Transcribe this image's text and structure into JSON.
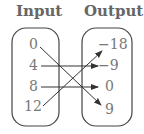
{
  "headers": {
    "input": "Input",
    "output": "Output"
  },
  "inputs": [
    "0",
    "4",
    "8",
    "12"
  ],
  "outputs": [
    "−18",
    "−9",
    "0",
    "9"
  ],
  "mappings": [
    {
      "from": "0",
      "to": "9"
    },
    {
      "from": "4",
      "to": "−9"
    },
    {
      "from": "8",
      "to": "0"
    },
    {
      "from": "12",
      "to": "−18"
    }
  ]
}
